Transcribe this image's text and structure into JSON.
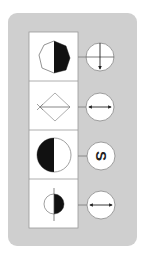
{
  "puzzle": {
    "background_color": "#cfcfcf",
    "rows": [
      {
        "shape": "heptagon",
        "shape_fill": "right-half-black",
        "symbol": "arrow-down-crosshair",
        "symbol_label": ""
      },
      {
        "shape": "diamond",
        "shape_fill": "horizontal-line",
        "symbol": "double-arrow-horizontal",
        "symbol_label": ""
      },
      {
        "shape": "circle-large",
        "shape_fill": "left-half-black",
        "symbol": "letter-s-rotated",
        "symbol_label": "S"
      },
      {
        "shape": "circle-small",
        "shape_fill": "right-half-black-vertical-line",
        "symbol": "double-arrow-horizontal",
        "symbol_label": ""
      }
    ]
  }
}
